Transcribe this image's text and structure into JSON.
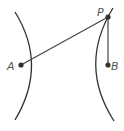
{
  "diagram": {
    "type": "hyperbola-focal-distance",
    "points": {
      "A": {
        "label": "A",
        "x": 21,
        "y": 65
      },
      "B": {
        "label": "B",
        "x": 108,
        "y": 65
      },
      "P": {
        "label": "P",
        "x": 108,
        "y": 17
      }
    },
    "segments": [
      {
        "from": "A",
        "to": "P"
      },
      {
        "from": "P",
        "to": "B"
      }
    ],
    "branches": [
      "left",
      "right"
    ],
    "colors": {
      "stroke": "#333333",
      "label": "#555555"
    }
  }
}
